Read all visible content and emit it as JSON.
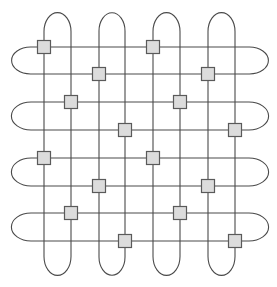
{
  "diagram": {
    "type": "woven-grid-loops",
    "width": 277,
    "height": 287,
    "colors": {
      "background": "#ffffff",
      "line": "#4a4a4a",
      "node_fill": "#dcdcdc",
      "node_stroke": "#5a5a5a"
    },
    "vertical_loops": [
      {
        "x1": 44,
        "x2": 71,
        "top": 18,
        "bottom": 270
      },
      {
        "x1": 99,
        "x2": 125,
        "top": 18,
        "bottom": 270
      },
      {
        "x1": 153,
        "x2": 180,
        "top": 18,
        "bottom": 270
      },
      {
        "x1": 208,
        "x2": 235,
        "top": 18,
        "bottom": 270
      }
    ],
    "horizontal_loops": [
      {
        "y1": 47,
        "y2": 74,
        "left": 17,
        "right": 263,
        "open_side": "left"
      },
      {
        "y1": 102,
        "y2": 130,
        "left": 17,
        "right": 263,
        "open_side": "left"
      },
      {
        "y1": 158,
        "y2": 186,
        "left": 17,
        "right": 263,
        "open_side": "left"
      },
      {
        "y1": 213,
        "y2": 241,
        "left": 17,
        "right": 263,
        "open_side": "left"
      }
    ],
    "node_size": 13,
    "nodes": [
      {
        "x": 44,
        "y": 47
      },
      {
        "x": 153,
        "y": 47
      },
      {
        "x": 99,
        "y": 74
      },
      {
        "x": 208,
        "y": 74
      },
      {
        "x": 71,
        "y": 102
      },
      {
        "x": 180,
        "y": 102
      },
      {
        "x": 125,
        "y": 130
      },
      {
        "x": 235,
        "y": 130
      },
      {
        "x": 44,
        "y": 158
      },
      {
        "x": 153,
        "y": 158
      },
      {
        "x": 99,
        "y": 186
      },
      {
        "x": 208,
        "y": 186
      },
      {
        "x": 71,
        "y": 213
      },
      {
        "x": 180,
        "y": 213
      },
      {
        "x": 125,
        "y": 241
      },
      {
        "x": 235,
        "y": 241
      }
    ]
  }
}
